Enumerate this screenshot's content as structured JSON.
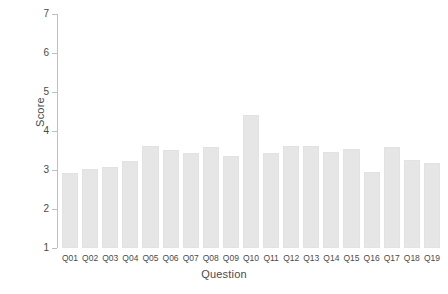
{
  "chart_data": {
    "type": "bar",
    "title": "",
    "xlabel": "Question",
    "ylabel": "Score",
    "categories": [
      "Q01",
      "Q02",
      "Q03",
      "Q04",
      "Q05",
      "Q06",
      "Q07",
      "Q08",
      "Q09",
      "Q10",
      "Q11",
      "Q12",
      "Q13",
      "Q14",
      "Q15",
      "Q16",
      "Q17",
      "Q18",
      "Q19"
    ],
    "values": [
      2.92,
      3.03,
      3.08,
      3.23,
      3.62,
      3.51,
      3.44,
      3.59,
      3.36,
      4.41,
      3.44,
      3.62,
      3.62,
      3.46,
      3.54,
      2.95,
      3.59,
      3.26,
      3.18
    ],
    "ylim": [
      1,
      7
    ],
    "ytick_labels": [
      "1",
      "2",
      "3",
      "4",
      "5",
      "6",
      "7"
    ],
    "yticks": [
      1,
      2,
      3,
      4,
      5,
      6,
      7
    ],
    "grid": false,
    "legend": "none",
    "bar_color": "#e6e6e6",
    "axis_color": "#bfbfbf",
    "text_color": "#4a4a4a",
    "background": "#ffffff",
    "baseline": 1
  }
}
